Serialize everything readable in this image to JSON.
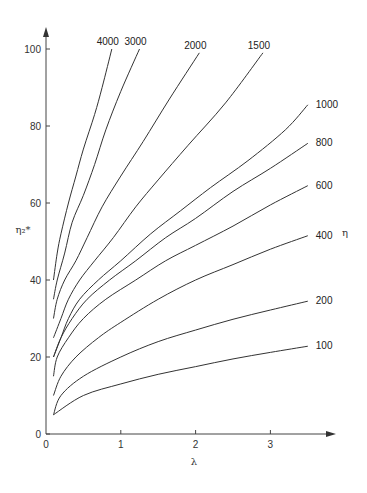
{
  "chart_data": {
    "type": "line",
    "title": "",
    "xlabel": "λ",
    "ylabel": "η₂*",
    "right_label": "η",
    "xlim": [
      0,
      3.5
    ],
    "ylim": [
      0,
      100
    ],
    "x_ticks": [
      0,
      1,
      2,
      3
    ],
    "y_ticks": [
      0,
      20,
      40,
      60,
      80,
      100
    ],
    "grid": false,
    "legend": "inline labels at curve ends",
    "series": [
      {
        "name": "100",
        "x": [
          0.1,
          0.5,
          1.0,
          1.5,
          2.0,
          2.5,
          3.0,
          3.5
        ],
        "y": [
          5,
          10,
          13,
          15.5,
          17.5,
          19.5,
          21.2,
          22.8
        ]
      },
      {
        "name": "200",
        "x": [
          0.1,
          0.2,
          0.5,
          1.0,
          1.5,
          2.0,
          2.5,
          3.0,
          3.5
        ],
        "y": [
          5,
          10,
          15,
          20,
          24,
          27,
          29.8,
          32.2,
          34.5
        ]
      },
      {
        "name": "400",
        "x": [
          0.1,
          0.2,
          0.4,
          0.7,
          1.0,
          1.5,
          2.0,
          2.5,
          3.0,
          3.5
        ],
        "y": [
          10,
          15,
          20,
          25,
          29,
          35,
          40,
          44,
          48,
          51.5
        ]
      },
      {
        "name": "600",
        "x": [
          0.1,
          0.15,
          0.3,
          0.5,
          0.8,
          1.2,
          1.6,
          2.0,
          2.5,
          3.0,
          3.5
        ],
        "y": [
          15,
          20,
          25,
          30,
          35,
          40,
          45,
          49,
          54,
          59.5,
          64.5
        ]
      },
      {
        "name": "800",
        "x": [
          0.1,
          0.2,
          0.35,
          0.55,
          0.85,
          1.2,
          1.6,
          2.0,
          2.5,
          3.0,
          3.5
        ],
        "y": [
          20,
          25,
          30,
          35,
          40,
          45,
          51,
          56,
          63,
          69,
          75.5
        ]
      },
      {
        "name": "1000",
        "x": [
          0.1,
          0.2,
          0.3,
          0.45,
          0.7,
          1.0,
          1.4,
          1.8,
          2.2,
          2.7,
          3.2,
          3.5
        ],
        "y": [
          20,
          25,
          30,
          35,
          40,
          45,
          52,
          58,
          64,
          71,
          79,
          85.5
        ]
      },
      {
        "name": "1500",
        "x": [
          0.1,
          0.2,
          0.3,
          0.45,
          0.65,
          0.9,
          1.2,
          1.5,
          1.9,
          2.4,
          2.9
        ],
        "y": [
          25,
          30,
          35,
          40,
          45,
          51,
          59,
          66,
          75,
          86,
          99
        ]
      },
      {
        "name": "2000",
        "x": [
          0.1,
          0.15,
          0.25,
          0.4,
          0.55,
          0.75,
          1.0,
          1.3,
          1.65,
          2.05
        ],
        "y": [
          30,
          35,
          40,
          45,
          51,
          59,
          67,
          76,
          87,
          99
        ]
      },
      {
        "name": "3000",
        "x": [
          0.1,
          0.15,
          0.25,
          0.35,
          0.5,
          0.65,
          0.8,
          1.0,
          1.25
        ],
        "y": [
          35,
          40,
          47,
          55,
          62,
          70,
          79,
          89,
          100
        ]
      },
      {
        "name": "4000",
        "x": [
          0.1,
          0.15,
          0.2,
          0.3,
          0.4,
          0.5,
          0.65,
          0.75,
          0.88
        ],
        "y": [
          40,
          47,
          52,
          60,
          67,
          74,
          83,
          90,
          100
        ]
      }
    ]
  },
  "labels": {
    "x_axis_title": "λ",
    "y_axis_title": "η₂*",
    "right_axis_title": "η"
  }
}
